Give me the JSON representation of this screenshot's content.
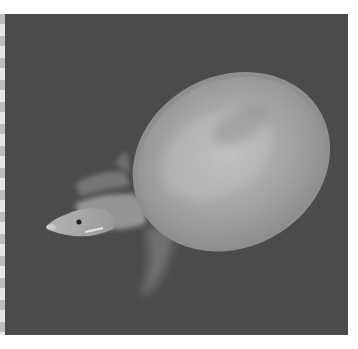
{
  "image": {
    "subject": "softshell turtle swimming in water, top view",
    "style": "grayscale photograph",
    "colors": {
      "background": "#ffffff",
      "water": "#4a4a4a",
      "shell": "#9a9a9a",
      "shell_highlight": "#c4c4c4",
      "head": "#a8a8a8",
      "limbs": "#8c8c8c"
    }
  }
}
